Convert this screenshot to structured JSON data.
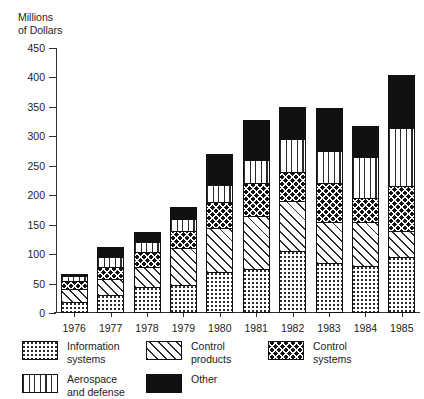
{
  "chart_data": {
    "type": "bar",
    "subtype": "stacked-bar",
    "title": "",
    "ylabel": "Millions\nof Dollars",
    "xlabel": "",
    "ylim": [
      0,
      450
    ],
    "ytick_step": 50,
    "yticks": [
      "0",
      "50",
      "100",
      "150",
      "200",
      "250",
      "300",
      "350",
      "400",
      "450"
    ],
    "grid": false,
    "legend_position": "below",
    "categories": [
      "1976",
      "1977",
      "1978",
      "1979",
      "1980",
      "1981",
      "1982",
      "1983",
      "1984",
      "1985"
    ],
    "series": [
      {
        "name": "Information systems",
        "legend_label": "Information\nsystems",
        "pattern": "fine-dots",
        "values": [
          18,
          30,
          45,
          48,
          70,
          75,
          105,
          85,
          80,
          95
        ]
      },
      {
        "name": "Control products",
        "legend_label": "Control\nproducts",
        "pattern": "diagonal-hatch",
        "values": [
          22,
          28,
          33,
          62,
          75,
          90,
          85,
          70,
          75,
          45
        ]
      },
      {
        "name": "Control systems",
        "legend_label": "Control\nsystems",
        "pattern": "diamond-crosshatch",
        "values": [
          14,
          20,
          25,
          30,
          43,
          55,
          50,
          65,
          40,
          75
        ]
      },
      {
        "name": "Aerospace and defense",
        "legend_label": "Aerospace\nand defense",
        "pattern": "vertical-lines",
        "values": [
          9,
          18,
          17,
          20,
          30,
          40,
          55,
          55,
          70,
          100
        ]
      },
      {
        "name": "Other",
        "legend_label": "Other",
        "pattern": "solid-black",
        "values": [
          3,
          16,
          17,
          20,
          52,
          68,
          55,
          73,
          53,
          90
        ]
      }
    ],
    "totals": [
      66,
      112,
      137,
      180,
      270,
      328,
      350,
      348,
      318,
      405
    ]
  }
}
